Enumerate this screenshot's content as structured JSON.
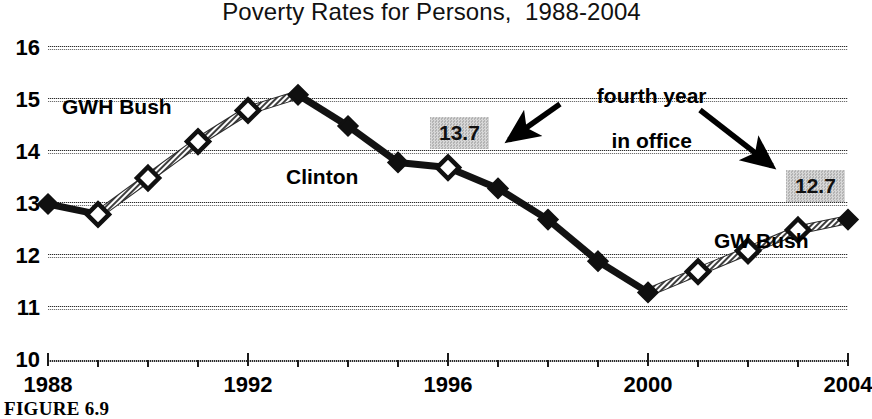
{
  "chart_data": {
    "type": "line",
    "title": "Poverty Rates for Persons,  1988-2004",
    "xlabel": "",
    "ylabel": "",
    "xlim": [
      1988,
      2004
    ],
    "ylim": [
      10,
      16
    ],
    "grid": true,
    "legend_position": "none",
    "x": [
      1988,
      1989,
      1990,
      1991,
      1992,
      1993,
      1994,
      1995,
      1996,
      1997,
      1998,
      1999,
      2000,
      2001,
      2002,
      2003,
      2004
    ],
    "values": [
      13.0,
      12.8,
      13.5,
      14.2,
      14.8,
      15.1,
      14.5,
      13.8,
      13.7,
      13.3,
      12.7,
      11.9,
      11.3,
      11.7,
      12.1,
      12.5,
      12.7
    ],
    "marker_styles": [
      "filled",
      "open",
      "open",
      "open",
      "open",
      "filled",
      "filled",
      "filled",
      "open",
      "filled",
      "filled",
      "filled",
      "filled",
      "open",
      "open",
      "open",
      "filled"
    ],
    "segment_styles": [
      "dark",
      "hatched",
      "hatched",
      "hatched",
      "hatched",
      "dark",
      "dark",
      "dark",
      "dark",
      "dark",
      "dark",
      "dark",
      "hatched",
      "hatched",
      "hatched",
      "hatched"
    ],
    "ytick_labels": [
      "16",
      "15",
      "14",
      "13",
      "12",
      "11",
      "10"
    ],
    "ytick_values": [
      16,
      15,
      14,
      13,
      12,
      11,
      10
    ],
    "xtick_values": [
      1988,
      1989,
      1990,
      1991,
      1992,
      1993,
      1994,
      1995,
      1996,
      1997,
      1998,
      1999,
      2000,
      2001,
      2002,
      2003,
      2004
    ],
    "xtick_labels": [
      {
        "value": 1988,
        "label": "1988"
      },
      {
        "value": 1992,
        "label": "1992"
      },
      {
        "value": 1996,
        "label": "1996"
      },
      {
        "value": 2000,
        "label": "2000"
      },
      {
        "value": 2004,
        "label": "2004"
      }
    ],
    "annotations": [
      {
        "id": "gwh-bush",
        "text": "GWH Bush",
        "kind": "series-label"
      },
      {
        "id": "clinton",
        "text": "Clinton",
        "kind": "series-label"
      },
      {
        "id": "gw-bush",
        "text": "GW Bush",
        "kind": "series-label"
      },
      {
        "id": "fourth-year",
        "text": "fourth year\nin office",
        "kind": "callout"
      },
      {
        "id": "value-1996",
        "text": "13.7",
        "kind": "value-box",
        "x": 1996,
        "y": 13.7
      },
      {
        "id": "value-2004",
        "text": "12.7",
        "kind": "value-box",
        "x": 2004,
        "y": 12.7
      }
    ]
  },
  "labels": {
    "gwh_bush": "GWH Bush",
    "clinton": "Clinton",
    "gw_bush": "GW Bush",
    "fourth_year_line1": "fourth year",
    "fourth_year_line2": "in office",
    "value_137": "13.7",
    "value_127": "12.7"
  },
  "caption": {
    "text": "FIGURE 6.9"
  },
  "colors": {
    "ink": "#000000",
    "gridline": "#4a4a4a",
    "value_box_bg": "#c7c7c7",
    "hatched_line": "#8a8a8a"
  }
}
